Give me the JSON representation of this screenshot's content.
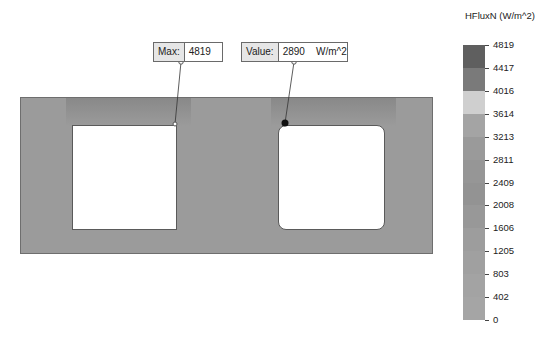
{
  "legend": {
    "title": "HFluxN (W/m^2)",
    "ticks": [
      "4819",
      "4417",
      "4016",
      "3614",
      "3213",
      "2811",
      "2409",
      "2008",
      "1606",
      "1205",
      "803",
      "402",
      "0"
    ],
    "bands": [
      "#5f5f5f",
      "#7a7a7a",
      "#cfcfcf",
      "#a4a4a4",
      "#9a9a9a",
      "#969696",
      "#939393",
      "#989898",
      "#9d9d9d",
      "#a0a0a0",
      "#a3a3a3",
      "#a5a5a5"
    ]
  },
  "probes": {
    "max": {
      "label": "Max:",
      "value": "4819"
    },
    "value": {
      "label": "Value:",
      "value": "2890    W/m^2"
    }
  },
  "colors": {
    "plate": "#9b9b9b",
    "hole": "#ffffff"
  }
}
